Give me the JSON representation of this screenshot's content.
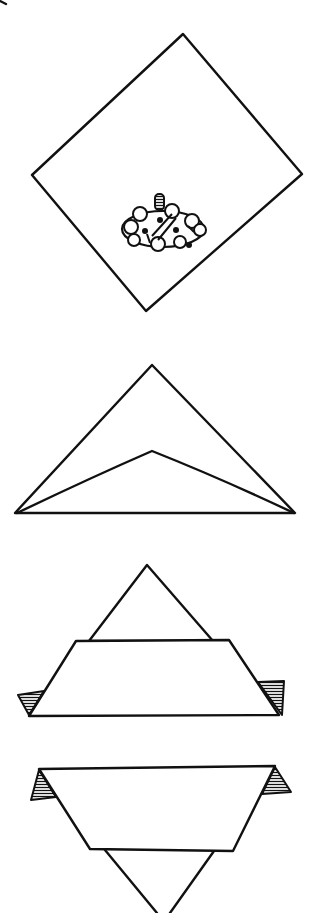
{
  "diagram": {
    "type": "folding-instructions",
    "colors": {
      "ink": "#111111",
      "paper": "#ffffff"
    },
    "steps": [
      {
        "step": 1,
        "label": "square-sheet-with-filling",
        "description": "Square sheet turned as a diamond with filling placed near lower corner"
      },
      {
        "step": 2,
        "label": "folded-into-triangle",
        "description": "Bottom corner folded up to top forming a triangle"
      },
      {
        "step": 3,
        "label": "bottom-band-folded",
        "description": "Lower edge folded up forming a band with side tabs"
      },
      {
        "step": 4,
        "label": "turned-over",
        "description": "Packet turned over, tabs at top corners, point facing down"
      }
    ]
  }
}
